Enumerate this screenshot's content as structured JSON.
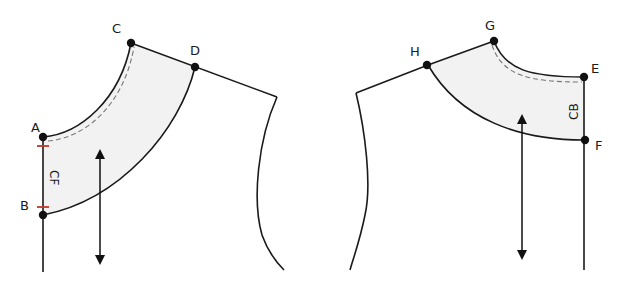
{
  "diagram": {
    "front": {
      "name": "Front bodice with neck facing",
      "points": [
        "A",
        "B",
        "C",
        "D"
      ],
      "edge_label": "CF",
      "notch_color": "#c0392b",
      "grainline": "double-headed arrow"
    },
    "back": {
      "name": "Back bodice with neck facing",
      "points": [
        "E",
        "F",
        "G",
        "H"
      ],
      "edge_label": "CB",
      "grainline": "double-headed arrow"
    },
    "colors": {
      "facing_fill": "#f2f2f2",
      "outline": "#1a1a1a",
      "dashed_seam": "#777777"
    }
  }
}
